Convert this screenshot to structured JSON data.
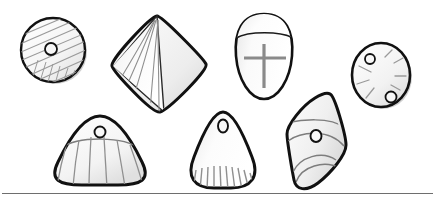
{
  "figure": {
    "title": "Line drawing plate of seven perforated stone beads / spindle whorls",
    "background_color": "#ffffff",
    "outline_color": "#111111",
    "incision_color": "#8a8a8a",
    "fill_light": "#fdfdfd",
    "fill_mid": "#ececec",
    "fill_shadow": "#d2d2d2",
    "width": 435,
    "height": 203
  },
  "rule": {
    "name": "bottom-horizontal-rule",
    "y": 193,
    "x_start": 2,
    "x_end": 433,
    "color": "#6e6e6e",
    "thickness": 1
  },
  "artifacts": [
    {
      "id": "a1",
      "label": "round disc bead with diagonal hatching",
      "shape": "circular-disc",
      "row": "top",
      "position": 1,
      "center_x": 53,
      "center_y": 50,
      "radius": 33,
      "perforations": 1,
      "perforation_positions": [
        [
          51,
          49
        ]
      ],
      "decoration": "parallel diagonal incised lines across face with cross-hatched lower-left sector"
    },
    {
      "id": "a2",
      "label": "rhomboid pyramid bead with vertical facet lines",
      "shape": "rhombus-pyramid",
      "row": "top",
      "position": 2,
      "center_x": 158,
      "center_y": 65,
      "width": 95,
      "height": 95,
      "perforations": 0,
      "perforation_positions": [],
      "decoration": "ridge from apex to base with curved facet lines on left face, plain shaded right face"
    },
    {
      "id": "a3",
      "label": "ovoid bead with collar band and incised cross",
      "shape": "ovoid-shield",
      "row": "top",
      "position": 3,
      "center_x": 264,
      "center_y": 58,
      "width": 55,
      "height": 85,
      "perforations": 0,
      "perforation_positions": [],
      "decoration": "horizontal collar band near top, large incised cross on body"
    },
    {
      "id": "a4",
      "label": "round disc with two perforations and radiating strokes",
      "shape": "circular-disc",
      "row": "top",
      "position": 4,
      "center_x": 381,
      "center_y": 75,
      "radius": 30,
      "perforations": 2,
      "perforation_positions": [
        [
          370,
          59
        ],
        [
          391,
          96
        ]
      ],
      "decoration": "short radiating incised strokes around the centre"
    },
    {
      "id": "a5",
      "label": "dome bead with perforation and radiating skirt lines",
      "shape": "rounded-dome",
      "row": "bottom",
      "position": 1,
      "center_x": 100,
      "center_y": 150,
      "width": 93,
      "height": 67,
      "perforations": 1,
      "perforation_positions": [
        [
          100,
          132
        ]
      ],
      "decoration": "arc band below perforation with fan of vertical incised lines to base"
    },
    {
      "id": "a6",
      "label": "conical bead with apex perforation and basal combing",
      "shape": "rounded-cone",
      "row": "bottom",
      "position": 2,
      "center_x": 225,
      "center_y": 152,
      "width": 68,
      "height": 80,
      "perforations": 1,
      "perforation_positions": [
        [
          223,
          126
        ]
      ],
      "decoration": "short vertical comb strokes along lower edge"
    },
    {
      "id": "a7",
      "label": "tilted lozenge bead with central perforation and transverse bands",
      "shape": "tilted-lozenge",
      "row": "bottom",
      "position": 3,
      "center_x": 318,
      "center_y": 142,
      "width": 60,
      "height": 95,
      "perforations": 1,
      "perforation_positions": [
        [
          316,
          136
        ]
      ],
      "decoration": "two curved transverse band lines dividing body into three facets"
    }
  ]
}
